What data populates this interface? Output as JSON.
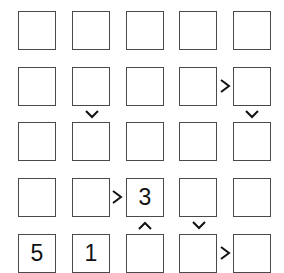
{
  "puzzle": {
    "type": "futoshiki",
    "size": 5,
    "grid": [
      [
        "",
        "",
        "",
        "",
        ""
      ],
      [
        "",
        "",
        "",
        "",
        ""
      ],
      [
        "",
        "",
        "",
        "",
        ""
      ],
      [
        "",
        "",
        "3",
        "",
        ""
      ],
      [
        "5",
        "1",
        "",
        "",
        ""
      ]
    ],
    "horizontal_constraints": [
      {
        "row": 2,
        "between_cols": [
          4,
          5
        ],
        "symbol": ">",
        "icon": "greater-than-icon"
      },
      {
        "row": 4,
        "between_cols": [
          2,
          3
        ],
        "symbol": ">",
        "icon": "greater-than-icon"
      },
      {
        "row": 5,
        "between_cols": [
          4,
          5
        ],
        "symbol": ">",
        "icon": "greater-than-icon"
      }
    ],
    "vertical_constraints": [
      {
        "col": 2,
        "between_rows": [
          2,
          3
        ],
        "symbol": "v",
        "icon": "chevron-down-icon"
      },
      {
        "col": 5,
        "between_rows": [
          2,
          3
        ],
        "symbol": "v",
        "icon": "chevron-down-icon"
      },
      {
        "col": 3,
        "between_rows": [
          4,
          5
        ],
        "symbol": "^",
        "icon": "chevron-up-icon"
      },
      {
        "col": 4,
        "between_rows": [
          4,
          5
        ],
        "symbol": "v",
        "icon": "chevron-down-icon"
      }
    ]
  },
  "colors": {
    "cell_border": "#4a4a4a",
    "sign": "#111111",
    "background": "#ffffff"
  }
}
